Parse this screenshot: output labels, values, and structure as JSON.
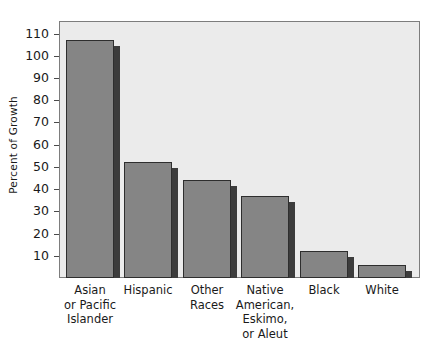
{
  "chart_data": {
    "type": "bar",
    "title": "",
    "xlabel": "",
    "ylabel": "Percent of Growth",
    "ylim": [
      0,
      117
    ],
    "yticks": [
      10,
      20,
      30,
      40,
      50,
      60,
      70,
      80,
      90,
      100,
      110
    ],
    "ytick_labels": [
      "10",
      "20",
      "30",
      "40",
      "50",
      "60",
      "70",
      "80",
      "90",
      "100",
      "110"
    ],
    "grid": false,
    "legend": false,
    "categories": [
      "Asian\nor Pacific\nIslander",
      "Hispanic",
      "Other\nRaces",
      "Native\nAmerican,\nEskimo,\nor Aleut",
      "Black",
      "White"
    ],
    "values": [
      107,
      52,
      44,
      37,
      12,
      6
    ],
    "series": [
      {
        "name": "Percent of Growth",
        "values": [
          107,
          52,
          44,
          37,
          12,
          6
        ]
      }
    ],
    "colors": {
      "bar_fill": "#858585",
      "bar_edge": "#2e2e2e",
      "bar_shadow": "#3c3c3c",
      "plot_background": "#ebebeb",
      "figure_background": "#ffffff",
      "axis": "#7d7d7d",
      "text": "#1a1a1a"
    }
  }
}
